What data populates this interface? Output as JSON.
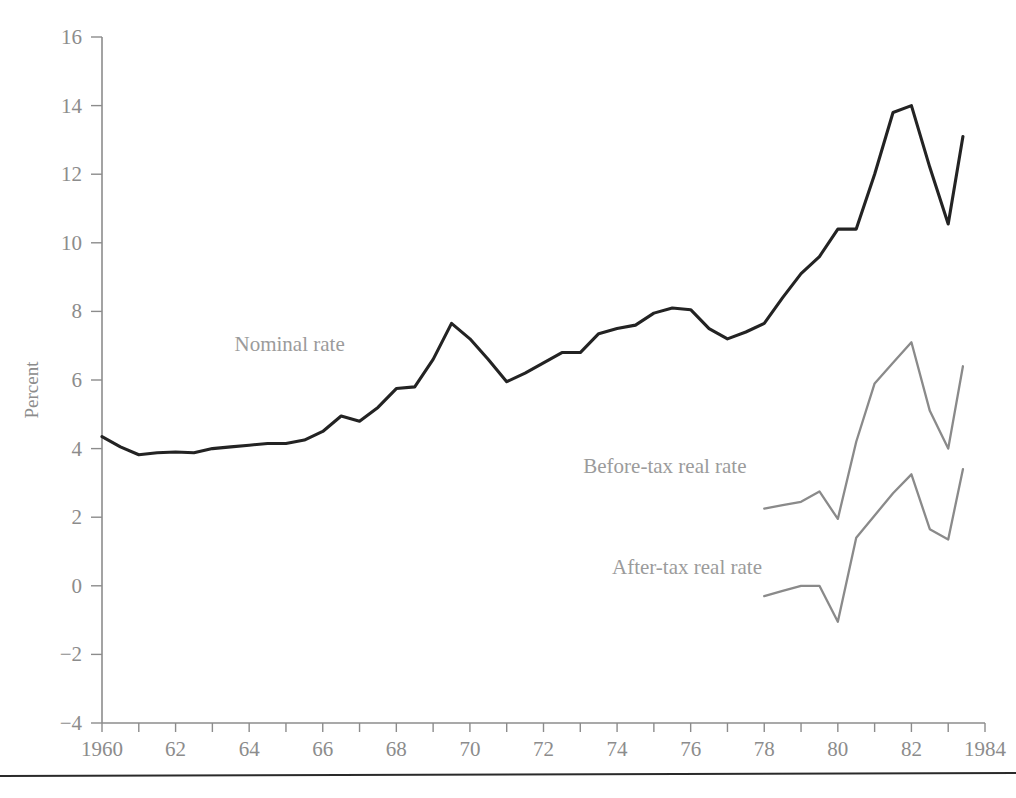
{
  "chart_data": {
    "type": "line",
    "title": "",
    "xlabel": "",
    "ylabel": "Percent",
    "xlim": [
      1960,
      1984
    ],
    "ylim": [
      -4,
      16
    ],
    "grid": false,
    "legend_position": "inline-annotations",
    "y_ticks": [
      -4,
      -2,
      0,
      2,
      4,
      6,
      8,
      10,
      12,
      14,
      16
    ],
    "y_tick_labels": [
      "−4",
      "−2",
      "0",
      "2",
      "4",
      "6",
      "8",
      "10",
      "12",
      "14",
      "16"
    ],
    "x_ticks": [
      1960,
      1961,
      1962,
      1963,
      1964,
      1965,
      1966,
      1967,
      1968,
      1969,
      1970,
      1971,
      1972,
      1973,
      1974,
      1975,
      1976,
      1977,
      1978,
      1979,
      1980,
      1981,
      1982,
      1983,
      1984
    ],
    "x_tick_labels": [
      "1960",
      "",
      "62",
      "",
      "64",
      "",
      "66",
      "",
      "68",
      "",
      "70",
      "",
      "72",
      "",
      "74",
      "",
      "76",
      "",
      "78",
      "",
      "80",
      "",
      "82",
      "",
      "1984"
    ],
    "series": [
      {
        "name": "Nominal rate",
        "color": "#232323",
        "label_x": 1965.1,
        "label_y": 6.85,
        "x": [
          1960.0,
          1960.5,
          1961.0,
          1961.5,
          1962.0,
          1962.5,
          1963.0,
          1963.5,
          1964.0,
          1964.5,
          1965.0,
          1965.5,
          1966.0,
          1966.5,
          1967.0,
          1967.5,
          1968.0,
          1968.5,
          1969.0,
          1969.5,
          1970.0,
          1970.5,
          1971.0,
          1971.5,
          1972.0,
          1972.5,
          1973.0,
          1973.5,
          1974.0,
          1974.5,
          1975.0,
          1975.5,
          1976.0,
          1976.5,
          1977.0,
          1977.5,
          1978.0,
          1978.5,
          1979.0,
          1979.5,
          1980.0,
          1980.5,
          1981.0,
          1981.5,
          1982.0,
          1982.5,
          1983.0,
          1983.4
        ],
        "y": [
          4.35,
          4.05,
          3.82,
          3.88,
          3.9,
          3.88,
          4.0,
          4.05,
          4.1,
          4.15,
          4.15,
          4.25,
          4.5,
          4.95,
          4.8,
          5.2,
          5.75,
          5.8,
          6.6,
          7.65,
          7.2,
          6.6,
          5.95,
          6.2,
          6.5,
          6.8,
          6.8,
          7.35,
          7.5,
          7.6,
          7.95,
          8.1,
          8.05,
          7.5,
          7.2,
          7.4,
          7.65,
          8.4,
          9.1,
          9.6,
          10.4,
          10.4,
          12.0,
          13.8,
          14.0,
          12.2,
          10.55,
          13.1
        ]
      },
      {
        "name": "Before-tax real rate",
        "color": "#8a8a8a",
        "label_x": 1975.3,
        "label_y": 3.3,
        "x": [
          1978.0,
          1978.5,
          1979.0,
          1979.5,
          1980.0,
          1980.5,
          1981.0,
          1981.5,
          1982.0,
          1982.5,
          1983.0,
          1983.4
        ],
        "y": [
          2.25,
          2.35,
          2.45,
          2.75,
          1.95,
          4.2,
          5.9,
          6.5,
          7.1,
          5.1,
          4.0,
          6.4
        ]
      },
      {
        "name": "After-tax real rate",
        "color": "#8a8a8a",
        "label_x": 1975.9,
        "label_y": 0.35,
        "x": [
          1978.0,
          1978.5,
          1979.0,
          1979.5,
          1980.0,
          1980.5,
          1981.0,
          1981.5,
          1982.0,
          1982.5,
          1983.0,
          1983.4
        ],
        "y": [
          -0.3,
          -0.15,
          0.0,
          0.0,
          -1.05,
          1.4,
          2.05,
          2.7,
          3.25,
          1.65,
          1.35,
          3.4
        ]
      }
    ]
  }
}
